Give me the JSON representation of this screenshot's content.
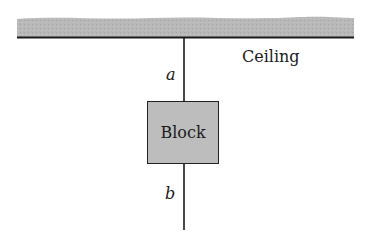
{
  "diagram": {
    "ceiling": {
      "label": "Ceiling",
      "fill_color": "#b8b8b8",
      "edge_color": "#1a1a1a"
    },
    "rope_upper": {
      "label": "a"
    },
    "block": {
      "label": "Block",
      "fill_color": "#bdbdbd"
    },
    "rope_lower": {
      "label": "b"
    }
  }
}
